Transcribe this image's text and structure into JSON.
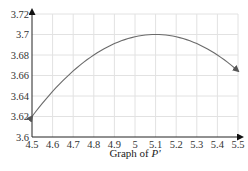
{
  "chart_data": {
    "type": "line",
    "title": "",
    "caption": "Graph of P'",
    "caption_parts": {
      "prefix": "Graph of ",
      "symbol": "P'"
    },
    "xlabel": "",
    "ylabel": "",
    "xlim": [
      4.5,
      5.5
    ],
    "ylim": [
      3.6,
      3.72
    ],
    "x_ticks": [
      "4.5",
      "4.6",
      "4.7",
      "4.8",
      "4.9",
      "5",
      "5.1",
      "5.2",
      "5.3",
      "5.4",
      "5.5"
    ],
    "y_ticks": [
      "3.6",
      "3.62",
      "3.64",
      "3.66",
      "3.68",
      "3.7",
      "3.72"
    ],
    "grid": true,
    "legend": null,
    "series": [
      {
        "name": "P'",
        "x": [
          4.5,
          4.6,
          4.7,
          4.8,
          4.9,
          5.0,
          5.1,
          5.2,
          5.3,
          5.4,
          5.5
        ],
        "values": [
          3.62,
          3.644,
          3.664,
          3.68,
          3.691,
          3.698,
          3.7,
          3.698,
          3.691,
          3.68,
          3.664
        ],
        "arrows_at_ends": true
      }
    ],
    "colors": {
      "curve": "#6b6b6b",
      "grid": "#e2e2e2",
      "axis": "#333333"
    }
  }
}
